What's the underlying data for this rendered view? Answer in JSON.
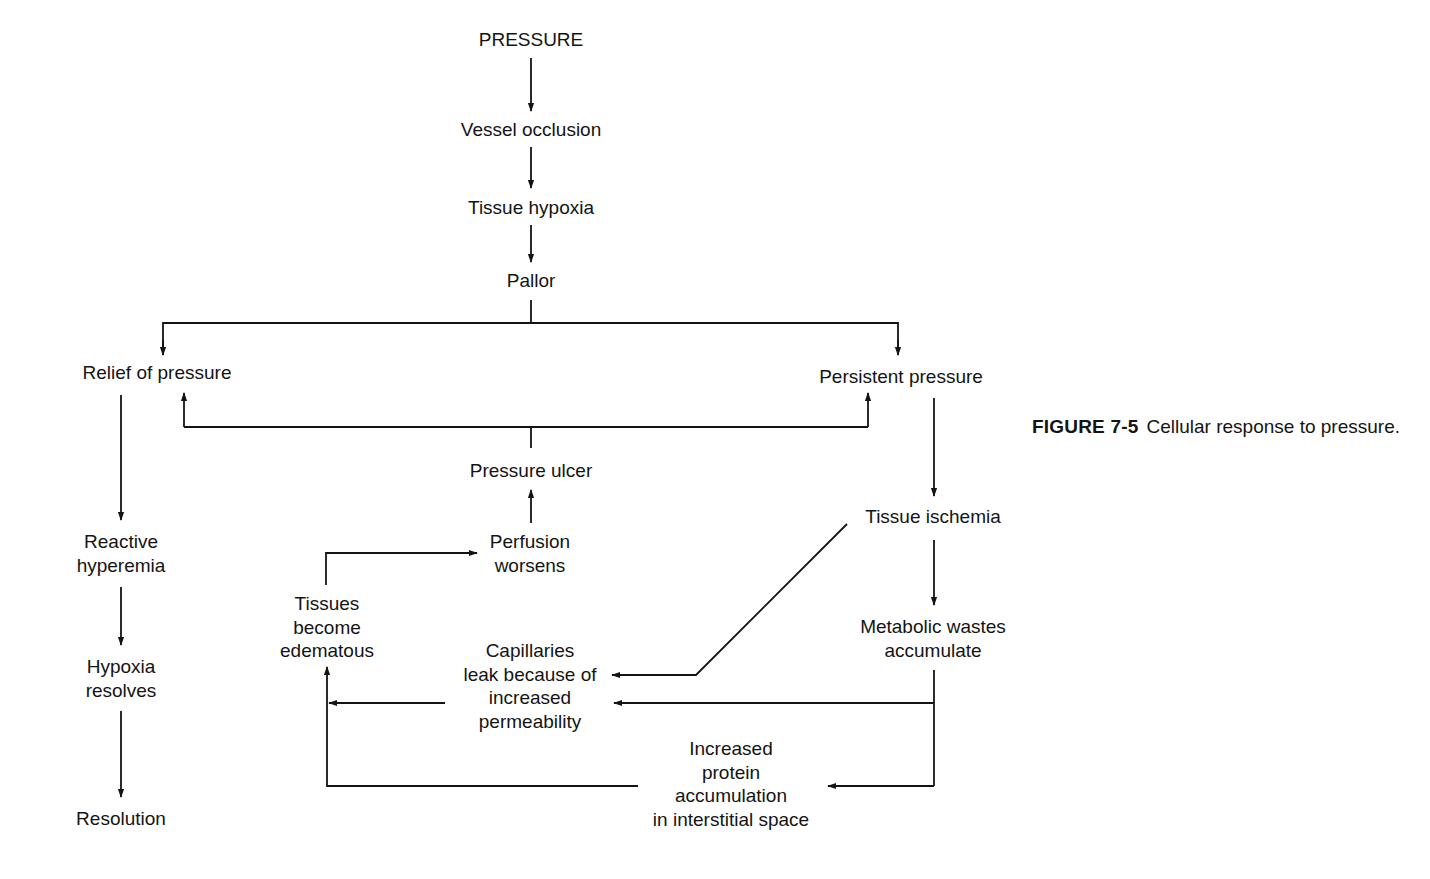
{
  "diagram": {
    "title": "Cellular response to pressure",
    "nodes": {
      "pressure": "PRESSURE",
      "vessel_occlusion": "Vessel occlusion",
      "tissue_hypoxia": "Tissue hypoxia",
      "pallor": "Pallor",
      "relief_of_pressure": "Relief of pressure",
      "persistent_pressure": "Persistent pressure",
      "pressure_ulcer": "Pressure ulcer",
      "reactive_hyperemia_1": "Reactive",
      "reactive_hyperemia_2": "hyperemia",
      "hypoxia_resolves_1": "Hypoxia",
      "hypoxia_resolves_2": "resolves",
      "resolution": "Resolution",
      "perfusion_worsens_1": "Perfusion",
      "perfusion_worsens_2": "worsens",
      "tissues_edematous_1": "Tissues",
      "tissues_edematous_2": "become",
      "tissues_edematous_3": "edematous",
      "capillaries_1": "Capillaries",
      "capillaries_2": "leak because of",
      "capillaries_3": "increased",
      "capillaries_4": "permeability",
      "tissue_ischemia": "Tissue ischemia",
      "metabolic_1": "Metabolic wastes",
      "metabolic_2": "accumulate",
      "protein_1": "Increased",
      "protein_2": "protein",
      "protein_3": "accumulation",
      "protein_4": "in interstitial space"
    },
    "edges": [
      [
        "PRESSURE",
        "Vessel occlusion"
      ],
      [
        "Vessel occlusion",
        "Tissue hypoxia"
      ],
      [
        "Tissue hypoxia",
        "Pallor"
      ],
      [
        "Pallor",
        "Relief of pressure"
      ],
      [
        "Pallor",
        "Persistent pressure"
      ],
      [
        "Pressure ulcer",
        "Relief of pressure"
      ],
      [
        "Pressure ulcer",
        "Persistent pressure"
      ],
      [
        "Relief of pressure",
        "Reactive hyperemia"
      ],
      [
        "Reactive hyperemia",
        "Hypoxia resolves"
      ],
      [
        "Hypoxia resolves",
        "Resolution"
      ],
      [
        "Persistent pressure",
        "Tissue ischemia"
      ],
      [
        "Tissue ischemia",
        "Metabolic wastes accumulate"
      ],
      [
        "Tissue ischemia",
        "Capillaries leak because of increased permeability"
      ],
      [
        "Metabolic wastes accumulate",
        "Capillaries leak because of increased permeability"
      ],
      [
        "Metabolic wastes accumulate",
        "Increased protein accumulation in interstitial space"
      ],
      [
        "Capillaries leak because of increased permeability",
        "Tissues become edematous"
      ],
      [
        "Increased protein accumulation in interstitial space",
        "Tissues become edematous"
      ],
      [
        "Tissues become edematous",
        "Perfusion worsens"
      ],
      [
        "Perfusion worsens",
        "Pressure ulcer"
      ]
    ]
  },
  "caption": {
    "figure_label": "FIGURE 7-5",
    "text": "Cellular response to pressure."
  }
}
